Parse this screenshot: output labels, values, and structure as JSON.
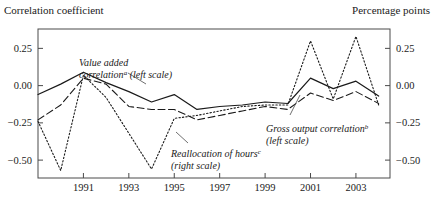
{
  "header": {
    "left_axis_title": "Correlation coefficient",
    "right_axis_title": "Percentage points"
  },
  "annotations": {
    "value_added": {
      "line1": "Value added",
      "line2_a": "correlation",
      "line2_sup": "a",
      "line2_b": " (left scale)"
    },
    "gross_output": {
      "line1_a": "Gross output correlation",
      "line1_sup": "b",
      "line2": "(left scale)"
    },
    "reallocation": {
      "line1_a": "Reallocation of hours",
      "line1_sup": "c",
      "line2": "(right scale)"
    }
  },
  "chart_data": {
    "type": "line",
    "title": "",
    "xlabel": "",
    "ylabel": "Correlation coefficient",
    "y2label": "Percentage points",
    "grid": false,
    "legend": "annotations-inline",
    "xlim": [
      1989,
      2004.5
    ],
    "ylim": [
      -0.62,
      0.38
    ],
    "y2lim": [
      -0.62,
      0.38
    ],
    "yticks": [
      0.25,
      0.0,
      -0.25,
      -0.5
    ],
    "ytick_labels": [
      "0.25",
      "0.00",
      "−0.25",
      "−0.50"
    ],
    "y2ticks": [
      0.25,
      0.0,
      -0.25,
      -0.5
    ],
    "y2tick_labels": [
      "0.25",
      "0.00",
      "−0.25",
      "−0.50"
    ],
    "xticks": [
      1991,
      1993,
      1995,
      1997,
      1999,
      2001,
      2003
    ],
    "xtick_labels": [
      "1991",
      "1993",
      "1995",
      "1997",
      "1999",
      "2001",
      "2003"
    ],
    "x": [
      1989,
      1990,
      1991,
      1992,
      1993,
      1994,
      1995,
      1996,
      1997,
      1998,
      1999,
      2000,
      2001,
      2002,
      2003,
      2004
    ],
    "series": [
      {
        "name": "Value added correlation (left scale)",
        "style": "solid",
        "color": "#1a1a1a",
        "values": [
          -0.06,
          0.01,
          0.09,
          0.02,
          -0.04,
          -0.11,
          -0.06,
          -0.16,
          -0.14,
          -0.13,
          -0.11,
          -0.12,
          0.05,
          -0.02,
          0.03,
          -0.07
        ]
      },
      {
        "name": "Gross output correlation (left scale)",
        "style": "dashed",
        "color": "#1a1a1a",
        "values": [
          -0.23,
          -0.13,
          0.05,
          0.01,
          -0.14,
          -0.16,
          -0.16,
          -0.23,
          -0.2,
          -0.17,
          -0.14,
          -0.16,
          -0.05,
          -0.1,
          -0.04,
          -0.12
        ]
      },
      {
        "name": "Reallocation of hours (right scale)",
        "style": "dotted",
        "color": "#1a1a1a",
        "values": [
          -0.24,
          -0.57,
          0.07,
          -0.08,
          -0.32,
          -0.56,
          -0.22,
          -0.2,
          -0.17,
          -0.14,
          -0.13,
          -0.13,
          0.3,
          -0.09,
          0.33,
          -0.13
        ]
      }
    ]
  }
}
